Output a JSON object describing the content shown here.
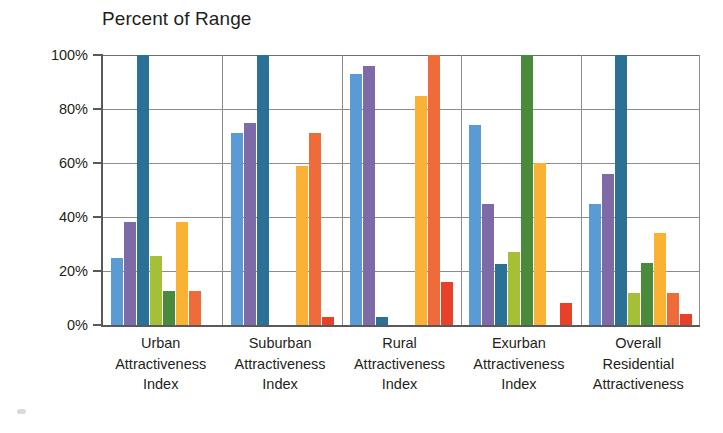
{
  "chart_data": {
    "type": "bar",
    "title": "Percent of Range",
    "xlabel": "",
    "ylabel": "",
    "ylim": [
      0,
      100
    ],
    "ytick_labels": [
      "100%",
      "80%",
      "60%",
      "40%",
      "20%",
      "0%"
    ],
    "ytick_values": [
      100,
      80,
      60,
      40,
      20,
      0
    ],
    "grid": true,
    "legend": "none",
    "categories": [
      "Urban Attractiveness Index",
      "Suburban Attractiveness Index",
      "Rural Attractiveness Index",
      "Exurban Attractiveness Index",
      "Overall Residential Attractiveness"
    ],
    "category_lines": [
      [
        "Urban",
        "Attractiveness",
        "Index"
      ],
      [
        "Suburban",
        "Attractiveness",
        "Index"
      ],
      [
        "Rural",
        "Attractiveness",
        "Index"
      ],
      [
        "Exurban",
        "Attractiveness",
        "Index"
      ],
      [
        "Overall",
        "Residential",
        "Attractiveness"
      ]
    ],
    "series": [
      {
        "name": "Series 1",
        "color": "#5b9bd5",
        "values": [
          25,
          71,
          93,
          74,
          45
        ]
      },
      {
        "name": "Series 2",
        "color": "#7f6aa8",
        "values": [
          38,
          75,
          96,
          45,
          56
        ]
      },
      {
        "name": "Series 3",
        "color": "#2a7195",
        "values": [
          100,
          100,
          3,
          22.5,
          100
        ]
      },
      {
        "name": "Series 4",
        "color": "#a5c036",
        "values": [
          25.5,
          0,
          0,
          27,
          12
        ]
      },
      {
        "name": "Series 5",
        "color": "#4a8b3b",
        "values": [
          12.5,
          0,
          0,
          100,
          23
        ]
      },
      {
        "name": "Series 6",
        "color": "#f9b233",
        "values": [
          38,
          59,
          85,
          60,
          34
        ]
      },
      {
        "name": "Series 7",
        "color": "#ef6c3a",
        "values": [
          12.5,
          71,
          100,
          0,
          12
        ]
      },
      {
        "name": "Series 8",
        "color": "#e8412a",
        "values": [
          0,
          3,
          16,
          8,
          4
        ]
      }
    ]
  },
  "colors": {
    "axis": "#58595b",
    "grid": "#8c8c8c",
    "text": "#231f20",
    "background": "#ffffff"
  }
}
